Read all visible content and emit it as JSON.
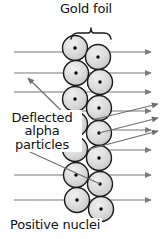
{
  "figure": {
    "title_concept": "Rutherford gold foil alpha scattering diagram",
    "background_color": "#ffffff",
    "line_color": "#777777",
    "outline_color": "#1a1a1a",
    "atom_fill": "#d9d9d9",
    "nucleus_color": "#000000",
    "text_color": "#111111"
  },
  "labels": {
    "gold_foil": "Gold foil",
    "deflected_line1": "Deflected",
    "deflected_line2": "alpha",
    "deflected_line3": "particles",
    "positive_nuclei": "Positive nuclei"
  },
  "diagram": {
    "beam_count": 8,
    "beam_y": [
      52,
      73,
      92,
      111,
      130,
      150,
      175,
      200
    ],
    "beam_x_start": 14,
    "beam_x_end": 158,
    "foil_x_left": 62,
    "foil_x_right": 112,
    "atom_radius": 12.5,
    "atoms": [
      {
        "cx": 75,
        "cy": 48
      },
      {
        "cx": 98,
        "cy": 57
      },
      {
        "cx": 76,
        "cy": 73
      },
      {
        "cx": 100,
        "cy": 82
      },
      {
        "cx": 75,
        "cy": 99
      },
      {
        "cx": 99,
        "cy": 108
      },
      {
        "cx": 75,
        "cy": 124
      },
      {
        "cx": 99,
        "cy": 133
      },
      {
        "cx": 75,
        "cy": 149
      },
      {
        "cx": 99,
        "cy": 158
      },
      {
        "cx": 76,
        "cy": 175
      },
      {
        "cx": 100,
        "cy": 184
      },
      {
        "cx": 77,
        "cy": 200
      },
      {
        "cx": 101,
        "cy": 209
      }
    ],
    "deflected_rays": [
      {
        "name": "backscatter-up-left",
        "x1": 75,
        "y1": 124,
        "x2": 28,
        "y2": 78,
        "arrow": "end"
      },
      {
        "name": "backscatter-down-left",
        "x1": 100,
        "y1": 184,
        "x2": 17,
        "y2": 146,
        "arrow": "end"
      },
      {
        "name": "deflect-up-right-a",
        "x1": 92,
        "y1": 120,
        "x2": 158,
        "y2": 104,
        "arrow": "end"
      },
      {
        "name": "deflect-up-right-b",
        "x1": 99,
        "y1": 133,
        "x2": 158,
        "y2": 118,
        "arrow": "end"
      },
      {
        "name": "deflect-up-right-c",
        "x1": 86,
        "y1": 150,
        "x2": 158,
        "y2": 131,
        "arrow": "end"
      }
    ],
    "brace": {
      "x_left": 71,
      "x_right": 111,
      "y": 33,
      "label_target": "Gold foil"
    }
  }
}
